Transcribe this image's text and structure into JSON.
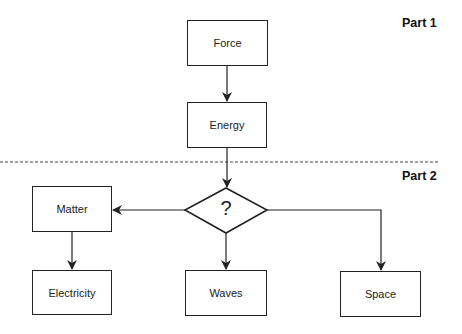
{
  "diagram": {
    "sections": [
      {
        "label": "Part 1"
      },
      {
        "label": "Part 2"
      }
    ],
    "nodes": {
      "force": {
        "label": "Force"
      },
      "energy": {
        "label": "Energy"
      },
      "decision": {
        "label": "?"
      },
      "matter": {
        "label": "Matter"
      },
      "electricity": {
        "label": "Electricity"
      },
      "waves": {
        "label": "Waves"
      },
      "space": {
        "label": "Space"
      }
    },
    "edges": [
      {
        "from": "Force",
        "to": "Energy"
      },
      {
        "from": "Energy",
        "to": "?"
      },
      {
        "from": "?",
        "to": "Matter"
      },
      {
        "from": "?",
        "to": "Waves"
      },
      {
        "from": "?",
        "to": "Space"
      },
      {
        "from": "Matter",
        "to": "Electricity"
      }
    ],
    "colors": {
      "stroke": "#222222",
      "background": "#ffffff"
    }
  }
}
